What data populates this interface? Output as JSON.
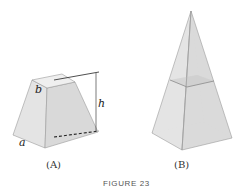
{
  "figure": {
    "title": "FIGURE 23",
    "panels": [
      {
        "id": "A",
        "caption": "(A)",
        "shape": "frustum of a square pyramid",
        "labels": {
          "top_side": "b",
          "bottom_side": "a",
          "height": "h"
        }
      },
      {
        "id": "B",
        "caption": "(B)",
        "shape": "square pyramid cut by a horizontal plane"
      }
    ]
  },
  "colors": {
    "face_light": "#ececec",
    "face_mid": "#dedede",
    "face_dark": "#d2d2d2",
    "edge": "#8a8a8a",
    "hidden_edge": "#b8b8b8",
    "dimension_line": "#222222"
  }
}
